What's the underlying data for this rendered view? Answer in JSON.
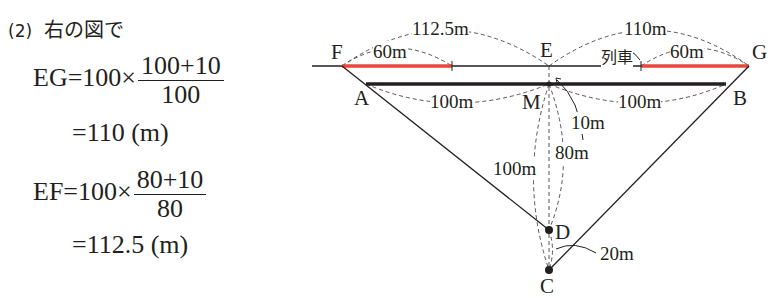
{
  "problem": {
    "number": "(2)",
    "intro": "右の図で"
  },
  "equations": [
    {
      "lhs": "EG",
      "prefix": "=100×",
      "numerator": "100+10",
      "denominator": "100",
      "result": "=110 (m)"
    },
    {
      "lhs": "EF",
      "prefix": "=100×",
      "numerator": "80+10",
      "denominator": "80",
      "result": "=112.5 (m)"
    }
  ],
  "diagram": {
    "points": {
      "F": "F",
      "E": "E",
      "G": "G",
      "A": "A",
      "M": "M",
      "B": "B",
      "D": "D",
      "C": "C"
    },
    "labels": {
      "EF_length": "112.5m",
      "EG_length": "110m",
      "train_left_length": "60m",
      "train_right_length": "60m",
      "train_label": "列車",
      "AM_length": "100m",
      "MB_length": "100m",
      "EM_length": "10m",
      "MC_length": "100m",
      "MD_length": "80m",
      "DC_length": "20m"
    },
    "colors": {
      "train": "#e8463f",
      "line": "#231f20",
      "dashed": "#555555"
    }
  }
}
